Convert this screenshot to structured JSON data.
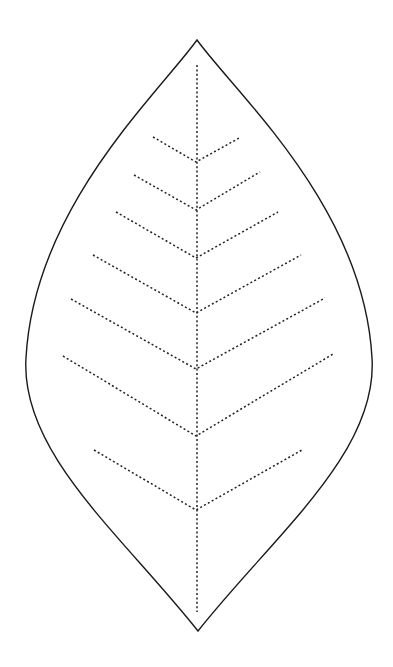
{
  "illustration": {
    "subject": "leaf outline with dotted veins",
    "colors": {
      "background": "#ffffff",
      "outline": "#1a1a1a",
      "veins": "#222222"
    },
    "leaf": {
      "top_tip": [
        197,
        40
      ],
      "bottom_tip": [
        198,
        631
      ],
      "widest_left": [
        26,
        358
      ],
      "widest_right": [
        372,
        358
      ]
    },
    "midrib": {
      "x": 197,
      "y_start": 65,
      "y_end": 612
    },
    "vein_pairs": [
      {
        "left": [
          153,
          137
        ],
        "junction": [
          196,
          162
        ],
        "right": [
          241,
          137
        ]
      },
      {
        "left": [
          134,
          175
        ],
        "junction": [
          196,
          210
        ],
        "right": [
          260,
          172
        ]
      },
      {
        "left": [
          116,
          212
        ],
        "junction": [
          196,
          258
        ],
        "right": [
          278,
          212
        ]
      },
      {
        "left": [
          93,
          255
        ],
        "junction": [
          196,
          313
        ],
        "right": [
          301,
          255
        ]
      },
      {
        "left": [
          71,
          299
        ],
        "junction": [
          196,
          369
        ],
        "right": [
          325,
          298
        ]
      },
      {
        "left": [
          63,
          356
        ],
        "junction": [
          196,
          436
        ],
        "right": [
          333,
          354
        ]
      },
      {
        "left": [
          94,
          450
        ],
        "junction": [
          196,
          510
        ],
        "right": [
          302,
          450
        ]
      }
    ]
  }
}
